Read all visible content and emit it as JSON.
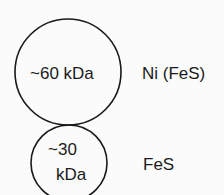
{
  "diagram": {
    "subunits": [
      {
        "id": "large",
        "mass_label": "~60 kDa",
        "cofactor_label": "Ni (FeS)"
      },
      {
        "id": "small",
        "mass_label_line1": "~30",
        "mass_label_line2": "kDa",
        "cofactor_label": "FeS"
      }
    ]
  }
}
